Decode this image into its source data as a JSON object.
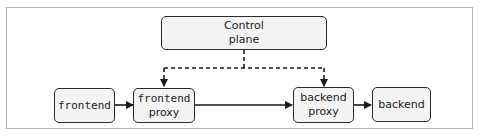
{
  "diagram": {
    "nodes": {
      "control_plane": {
        "line1": "Control",
        "line2": "plane"
      },
      "frontend": {
        "label": "frontend"
      },
      "frontend_proxy": {
        "line1": "frontend",
        "line2": "proxy"
      },
      "backend_proxy": {
        "line1": "backend",
        "line2": "proxy"
      },
      "backend": {
        "label": "backend"
      }
    },
    "edges": [
      {
        "from": "frontend",
        "to": "frontend_proxy",
        "style": "solid"
      },
      {
        "from": "frontend_proxy",
        "to": "backend_proxy",
        "style": "solid"
      },
      {
        "from": "backend_proxy",
        "to": "backend",
        "style": "solid"
      },
      {
        "from": "control_plane",
        "to": "frontend_proxy",
        "style": "dashed"
      },
      {
        "from": "control_plane",
        "to": "backend_proxy",
        "style": "dashed"
      }
    ]
  }
}
